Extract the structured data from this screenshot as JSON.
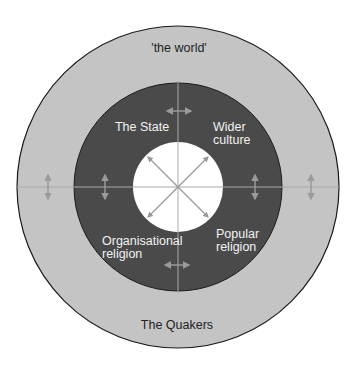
{
  "diagram": {
    "outer_ring_label": "'the world'",
    "bottom_label": "The Quakers",
    "quadrants": {
      "top_left": "The State",
      "top_right_line1": "Wider",
      "top_right_line2": "culture",
      "bottom_left_line1": "Organisational",
      "bottom_left_line2": "religion",
      "bottom_right_line1": "Popular",
      "bottom_right_line2": "religion"
    },
    "colors": {
      "outer_ring": "#c4c4c4",
      "middle_ring": "#4a4a4a",
      "inner_circle": "#ffffff",
      "arrows": "#9a9a9a",
      "divider_lines": "#a8a8a8",
      "outline": "#1a1a1a"
    }
  }
}
